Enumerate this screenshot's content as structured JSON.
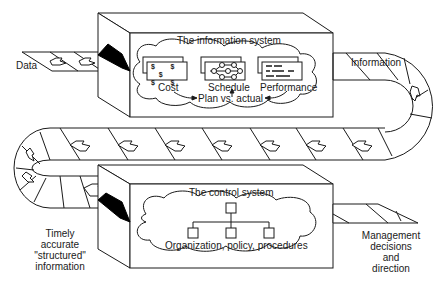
{
  "diagram": {
    "type": "flow",
    "inputs": {
      "data": "Data",
      "timely_info": [
        "Timely",
        "accurate",
        "\"structured\"",
        "information"
      ]
    },
    "outputs": {
      "information": "Information",
      "management": [
        "Management",
        "decisions",
        "and",
        "direction"
      ]
    },
    "information_system": {
      "title": "The information system",
      "components": [
        {
          "label": "Cost",
          "icon": "dollar-document-icon"
        },
        {
          "label": "Schedule",
          "icon": "network-diagram-icon"
        },
        {
          "label": "Performance",
          "icon": "handwritten-document-icon"
        }
      ],
      "comparison": "Plan vs. actual"
    },
    "control_system": {
      "title": "The control system",
      "caption": "Organization, policy, procedures",
      "icon": "org-chart-icon"
    },
    "colors": {
      "line": "#1a1a1a",
      "background": "#ffffff",
      "feed_slot": "#000000"
    }
  }
}
